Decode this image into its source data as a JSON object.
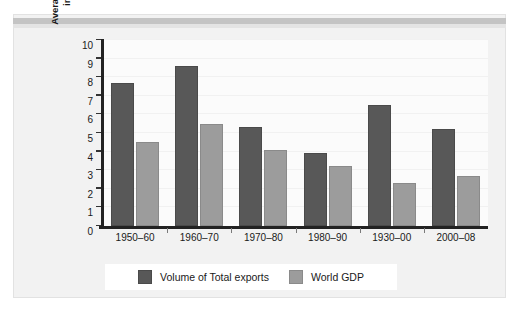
{
  "chart_data": {
    "type": "bar",
    "title": "",
    "xlabel": "",
    "ylabel": "Average annual percentage increase in volume",
    "ylabel_line1": "Average annual percentage",
    "ylabel_line2": "increase in volume",
    "categories": [
      "1950–60",
      "1960–70",
      "1970–80",
      "1980–90",
      "1930–00",
      "2000–08"
    ],
    "series": [
      {
        "name": "Volume of Total exports",
        "color": "#585858",
        "values": [
          7.7,
          8.6,
          5.3,
          3.9,
          6.5,
          5.2
        ]
      },
      {
        "name": "World GDP",
        "color": "#9c9c9c",
        "values": [
          4.5,
          5.5,
          4.1,
          3.2,
          2.3,
          2.7
        ]
      }
    ],
    "ylim": [
      0,
      10
    ],
    "yticks": [
      0,
      1,
      2,
      3,
      4,
      5,
      6,
      7,
      8,
      9,
      10
    ],
    "ytick_labels": [
      "0",
      "1",
      "2",
      "3",
      "4",
      "5",
      "6",
      "7",
      "8",
      "9",
      "10"
    ],
    "grid": true,
    "legend_position": "bottom"
  },
  "legend": {
    "items": [
      {
        "label": "Volume of Total exports",
        "color": "#585858"
      },
      {
        "label": "World GDP",
        "color": "#9c9c9c"
      }
    ]
  },
  "colors": {
    "series_dark": "#585858",
    "series_light": "#9c9c9c",
    "figure_background": "#f2f2f2",
    "plot_background": "#fbfbfb",
    "axis": "#222222",
    "text": "#1a1a1a"
  }
}
